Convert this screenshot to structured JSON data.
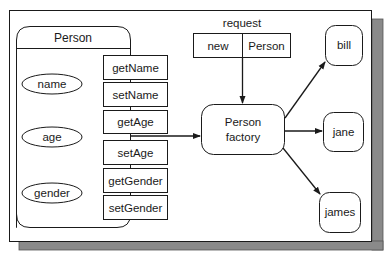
{
  "diagram": {
    "colors": {
      "stroke": "#1a1a1a",
      "shadow": "#8a8a8a",
      "background": "#ffffff"
    },
    "person_class": {
      "title": "Person",
      "attributes": [
        "name",
        "age",
        "gender"
      ],
      "methods": [
        "getName",
        "setName",
        "getAge",
        "setAge",
        "getGender",
        "setGender"
      ]
    },
    "request": {
      "label": "request",
      "cells": [
        "new",
        "Person"
      ]
    },
    "factory": {
      "line1": "Person",
      "line2": "factory"
    },
    "instances": [
      "bill",
      "jane",
      "james"
    ]
  }
}
